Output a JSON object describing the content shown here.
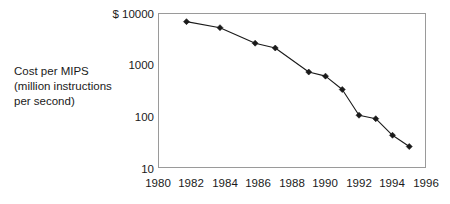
{
  "chart_data": {
    "type": "line",
    "title": "",
    "subtitle": "",
    "xlabel": "",
    "ylabel": "Cost per MIPS (million instructions per second)",
    "ylabel_lines": [
      "Cost per MIPS",
      "(million instructions",
      "per second)"
    ],
    "y_axis_prefix": "$",
    "y_scale": "log",
    "ylim": [
      10,
      10000
    ],
    "y_ticks": [
      10000,
      1000,
      100,
      10
    ],
    "y_tick_labels": [
      "$ 10000",
      "1000",
      "100",
      "10"
    ],
    "xlim": [
      1980,
      1996
    ],
    "x_ticks": [
      1980,
      1982,
      1984,
      1986,
      1988,
      1990,
      1992,
      1994,
      1996
    ],
    "x_tick_labels": [
      "1980",
      "1982",
      "1984",
      "1986",
      "1988",
      "1990",
      "1992",
      "1994",
      "1996"
    ],
    "grid": false,
    "legend": false,
    "legend_position": "none",
    "marker": "diamond",
    "line_color": "#1a1a1a",
    "marker_color": "#1a1a1a",
    "frame_color": "#9a9a9a",
    "background_color": "#ffffff",
    "series": [
      {
        "name": "Cost per MIPS",
        "x": [
          1981.7,
          1983.7,
          1985.8,
          1987.0,
          1989.0,
          1990.0,
          1991.0,
          1992.0,
          1993.0,
          1994.0,
          1995.0
        ],
        "values": [
          6800,
          5200,
          2600,
          2100,
          720,
          600,
          330,
          105,
          90,
          43,
          26
        ]
      }
    ]
  },
  "annotations": []
}
